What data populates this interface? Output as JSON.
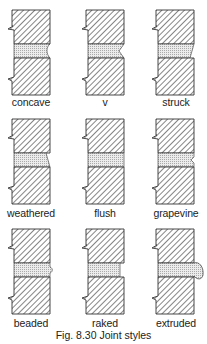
{
  "figure": {
    "caption": "Fig. 8.30 Joint styles",
    "colors": {
      "outline": "#333333",
      "hatch": "#444444",
      "mortar_fill": "#e6e6e6",
      "mortar_dots": "#9a9a9a",
      "background": "#ffffff"
    },
    "panels": [
      {
        "id": "concave",
        "label": "concave",
        "row": 0,
        "col": 0,
        "joint": "concave"
      },
      {
        "id": "v",
        "label": "v",
        "row": 0,
        "col": 1,
        "joint": "v"
      },
      {
        "id": "struck",
        "label": "struck",
        "row": 0,
        "col": 2,
        "joint": "struck"
      },
      {
        "id": "weathered",
        "label": "weathered",
        "row": 1,
        "col": 0,
        "joint": "weathered"
      },
      {
        "id": "flush",
        "label": "flush",
        "row": 1,
        "col": 1,
        "joint": "flush"
      },
      {
        "id": "grapevine",
        "label": "grapevine",
        "row": 1,
        "col": 2,
        "joint": "grapevine"
      },
      {
        "id": "beaded",
        "label": "beaded",
        "row": 2,
        "col": 0,
        "joint": "beaded"
      },
      {
        "id": "raked",
        "label": "raked",
        "row": 2,
        "col": 1,
        "joint": "raked"
      },
      {
        "id": "extruded",
        "label": "extruded",
        "row": 2,
        "col": 2,
        "joint": "extruded"
      }
    ]
  }
}
